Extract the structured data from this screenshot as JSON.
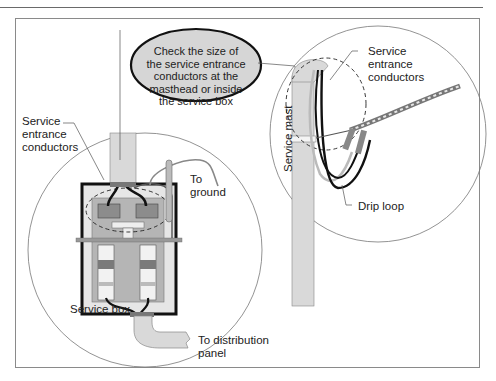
{
  "diagram": {
    "type": "technical-illustration",
    "callout": {
      "text": "Check the size of\nthe service entrance\nconductors at the\nmasthead or inside\nthe service box"
    },
    "left_detail": {
      "labels": {
        "service_entrance_conductors": "Service\nentrance\nconductors",
        "to_ground": "To\nground",
        "service_box": "Service box",
        "to_distribution_panel": "To distribution\npanel"
      }
    },
    "right_detail": {
      "labels": {
        "service_entrance_conductors": "Service\nentrance\nconductors",
        "service_mast": "Service mast",
        "drip_loop": "Drip loop"
      }
    },
    "colors": {
      "frame": "#8a8a8a",
      "fill_gray": "#d9d9d9",
      "panel_gray": "#b5b5b5",
      "dark_line": "#111111",
      "callout_fill": "#d6d6d6"
    }
  }
}
